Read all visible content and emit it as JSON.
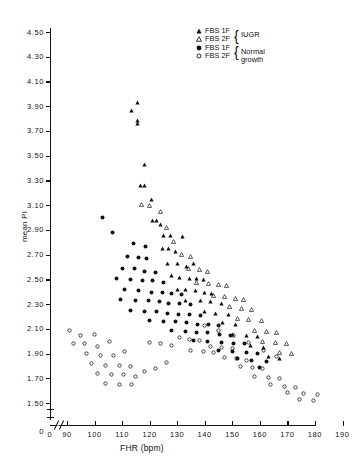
{
  "chart_data": {
    "type": "scatter",
    "title": "",
    "xlabel": "FHR (bpm)",
    "ylabel": "mean PI",
    "xlim": [
      85,
      190
    ],
    "ylim": [
      1.5,
      4.5
    ],
    "x_ticks": [
      "0",
      "90",
      "100",
      "110",
      "120",
      "130",
      "140",
      "150",
      "160",
      "170",
      "180",
      "190"
    ],
    "y_ticks": [
      "4.50",
      "4.30",
      "4.10",
      "3.90",
      "3.70",
      "3.50",
      "3.30",
      "3.10",
      "2.90",
      "2.70",
      "2.50",
      "2.30",
      "2.10",
      "1.90",
      "1.70",
      "1.50",
      "0"
    ],
    "axis_break_x": true,
    "axis_break_y": true,
    "grid": false,
    "legend_position": "top-right",
    "series": [
      {
        "name": "FBS 1F",
        "group": "IUGR",
        "marker": "filled-triangle",
        "color": "#111111",
        "points": [
          [
            115.5,
            4.0
          ],
          [
            113.5,
            3.94
          ],
          [
            115.5,
            3.86
          ],
          [
            115.5,
            3.83
          ],
          [
            118.0,
            3.5
          ],
          [
            116.5,
            3.33
          ],
          [
            118.0,
            3.33
          ],
          [
            120.5,
            3.22
          ],
          [
            121.0,
            3.05
          ],
          [
            122.5,
            3.05
          ],
          [
            124.0,
            3.02
          ],
          [
            125.0,
            2.93
          ],
          [
            127.5,
            2.93
          ],
          [
            132.0,
            2.92
          ],
          [
            124.5,
            2.82
          ],
          [
            127.0,
            2.82
          ],
          [
            129.5,
            2.8
          ],
          [
            126.5,
            2.7
          ],
          [
            130.0,
            2.7
          ],
          [
            133.5,
            2.68
          ],
          [
            136.0,
            2.7
          ],
          [
            128.0,
            2.6
          ],
          [
            131.0,
            2.59
          ],
          [
            134.5,
            2.58
          ],
          [
            137.0,
            2.58
          ],
          [
            139.5,
            2.57
          ],
          [
            130.0,
            2.49
          ],
          [
            133.0,
            2.49
          ],
          [
            136.5,
            2.48
          ],
          [
            140.0,
            2.47
          ],
          [
            142.5,
            2.46
          ],
          [
            133.0,
            2.4
          ],
          [
            138.5,
            2.4
          ],
          [
            142.0,
            2.39
          ],
          [
            146.0,
            2.38
          ],
          [
            140.0,
            2.31
          ],
          [
            144.0,
            2.3
          ],
          [
            148.5,
            2.29
          ],
          [
            146.5,
            2.22
          ],
          [
            151.0,
            2.21
          ],
          [
            150.0,
            2.13
          ],
          [
            155.0,
            2.12
          ],
          [
            159.0,
            2.11
          ],
          [
            156.5,
            2.04
          ],
          [
            161.5,
            2.02
          ],
          [
            163.0,
            1.95
          ],
          [
            167.0,
            1.93
          ]
        ]
      },
      {
        "name": "FBS 2F",
        "group": "IUGR",
        "marker": "open-triangle",
        "color": "#111111",
        "points": [
          [
            117.0,
            3.18
          ],
          [
            120.0,
            3.17
          ],
          [
            124.0,
            3.12
          ],
          [
            126.0,
            2.99
          ],
          [
            128.5,
            2.88
          ],
          [
            131.5,
            2.77
          ],
          [
            135.0,
            2.76
          ],
          [
            134.0,
            2.66
          ],
          [
            138.0,
            2.65
          ],
          [
            141.0,
            2.64
          ],
          [
            137.0,
            2.55
          ],
          [
            141.5,
            2.54
          ],
          [
            145.0,
            2.53
          ],
          [
            148.0,
            2.52
          ],
          [
            143.0,
            2.44
          ],
          [
            147.0,
            2.43
          ],
          [
            151.0,
            2.42
          ],
          [
            154.0,
            2.41
          ],
          [
            149.0,
            2.35
          ],
          [
            153.5,
            2.34
          ],
          [
            157.0,
            2.33
          ],
          [
            152.0,
            2.26
          ],
          [
            156.0,
            2.25
          ],
          [
            160.5,
            2.24
          ],
          [
            158.0,
            2.16
          ],
          [
            162.5,
            2.15
          ],
          [
            166.0,
            2.14
          ],
          [
            161.0,
            2.07
          ],
          [
            165.5,
            2.06
          ],
          [
            169.5,
            2.05
          ],
          [
            167.0,
            1.98
          ],
          [
            171.5,
            1.97
          ]
        ]
      },
      {
        "name": "FBS 1F",
        "group": "Normal growth",
        "marker": "filled-circle",
        "color": "#111111",
        "points": [
          [
            103.0,
            3.07
          ],
          [
            106.5,
            2.95
          ],
          [
            114.0,
            2.86
          ],
          [
            118.5,
            2.84
          ],
          [
            112.0,
            2.76
          ],
          [
            116.0,
            2.75
          ],
          [
            119.0,
            2.74
          ],
          [
            110.0,
            2.66
          ],
          [
            114.5,
            2.66
          ],
          [
            118.0,
            2.64
          ],
          [
            122.0,
            2.63
          ],
          [
            108.0,
            2.58
          ],
          [
            113.0,
            2.57
          ],
          [
            117.5,
            2.56
          ],
          [
            121.0,
            2.56
          ],
          [
            125.0,
            2.55
          ],
          [
            111.0,
            2.49
          ],
          [
            116.0,
            2.48
          ],
          [
            120.5,
            2.47
          ],
          [
            124.5,
            2.47
          ],
          [
            128.0,
            2.46
          ],
          [
            131.5,
            2.45
          ],
          [
            109.5,
            2.41
          ],
          [
            115.0,
            2.4
          ],
          [
            119.5,
            2.4
          ],
          [
            123.5,
            2.39
          ],
          [
            127.0,
            2.38
          ],
          [
            131.0,
            2.38
          ],
          [
            135.0,
            2.37
          ],
          [
            113.0,
            2.32
          ],
          [
            118.0,
            2.31
          ],
          [
            122.5,
            2.31
          ],
          [
            126.5,
            2.3
          ],
          [
            130.5,
            2.29
          ],
          [
            134.5,
            2.29
          ],
          [
            138.5,
            2.28
          ],
          [
            120.0,
            2.24
          ],
          [
            125.0,
            2.23
          ],
          [
            129.5,
            2.23
          ],
          [
            133.5,
            2.22
          ],
          [
            137.5,
            2.21
          ],
          [
            141.5,
            2.21
          ],
          [
            145.0,
            2.2
          ],
          [
            128.0,
            2.16
          ],
          [
            133.0,
            2.15
          ],
          [
            137.0,
            2.14
          ],
          [
            141.0,
            2.14
          ],
          [
            145.5,
            2.13
          ],
          [
            149.5,
            2.12
          ],
          [
            136.0,
            2.08
          ],
          [
            141.0,
            2.07
          ],
          [
            146.0,
            2.06
          ],
          [
            150.5,
            2.05
          ],
          [
            154.5,
            2.05
          ],
          [
            145.0,
            2.0
          ],
          [
            150.0,
            1.99
          ],
          [
            155.0,
            1.98
          ],
          [
            159.0,
            1.97
          ],
          [
            152.0,
            1.93
          ],
          [
            157.0,
            1.92
          ],
          [
            162.5,
            1.91
          ],
          [
            160.0,
            1.86
          ]
        ]
      },
      {
        "name": "FBS 2F",
        "group": "Normal growth",
        "marker": "open-circle",
        "color": "#111111",
        "points": [
          [
            91.0,
            2.16
          ],
          [
            95.0,
            2.12
          ],
          [
            100.0,
            2.13
          ],
          [
            92.5,
            2.05
          ],
          [
            96.5,
            2.05
          ],
          [
            101.0,
            2.03
          ],
          [
            105.5,
            2.07
          ],
          [
            97.0,
            1.97
          ],
          [
            102.0,
            1.96
          ],
          [
            107.0,
            1.96
          ],
          [
            111.0,
            1.99
          ],
          [
            99.0,
            1.89
          ],
          [
            104.0,
            1.88
          ],
          [
            109.0,
            1.88
          ],
          [
            113.0,
            1.87
          ],
          [
            101.0,
            1.81
          ],
          [
            106.0,
            1.8
          ],
          [
            110.5,
            1.8
          ],
          [
            115.0,
            1.79
          ],
          [
            104.0,
            1.73
          ],
          [
            109.0,
            1.72
          ],
          [
            113.5,
            1.72
          ],
          [
            118.0,
            1.83
          ],
          [
            122.0,
            1.85
          ],
          [
            126.0,
            1.9
          ],
          [
            120.0,
            2.06
          ],
          [
            124.0,
            2.05
          ],
          [
            128.0,
            2.04
          ],
          [
            131.0,
            2.1
          ],
          [
            134.5,
            2.09
          ],
          [
            138.0,
            2.08
          ],
          [
            135.0,
            2.0
          ],
          [
            139.5,
            1.99
          ],
          [
            143.0,
            1.98
          ],
          [
            142.0,
            2.03
          ],
          [
            146.0,
            2.02
          ],
          [
            150.0,
            2.01
          ],
          [
            147.0,
            1.94
          ],
          [
            151.5,
            1.93
          ],
          [
            155.0,
            1.92
          ],
          [
            153.0,
            1.87
          ],
          [
            157.5,
            1.86
          ],
          [
            161.0,
            1.85
          ],
          [
            158.0,
            1.79
          ],
          [
            163.0,
            1.78
          ],
          [
            167.0,
            1.77
          ],
          [
            164.0,
            1.72
          ],
          [
            169.0,
            1.71
          ],
          [
            173.0,
            1.7
          ],
          [
            170.0,
            1.66
          ],
          [
            176.0,
            1.65
          ],
          [
            181.0,
            1.64
          ],
          [
            174.5,
            1.6
          ],
          [
            179.5,
            1.59
          ],
          [
            166.0,
            1.95
          ],
          [
            161.5,
            2.0
          ],
          [
            156.0,
            2.06
          ],
          [
            150.5,
            2.12
          ],
          [
            145.0,
            2.16
          ],
          [
            140.0,
            2.2
          ]
        ]
      }
    ]
  },
  "legend": {
    "rows": [
      {
        "marker": "filled-triangle",
        "label": "FBS 1F"
      },
      {
        "marker": "open-triangle",
        "label": "FBS 2F"
      },
      {
        "marker": "filled-circle",
        "label": "FBS 1F"
      },
      {
        "marker": "open-circle",
        "label": "FBS 2F"
      }
    ],
    "groups": [
      {
        "label": "IUGR"
      },
      {
        "label": "Normal growth"
      }
    ],
    "brace": "{"
  },
  "axes": {
    "y_title": "mean PI",
    "x_title": "FHR (bpm)",
    "y_zero_label": "0",
    "x_zero_label": "0"
  }
}
